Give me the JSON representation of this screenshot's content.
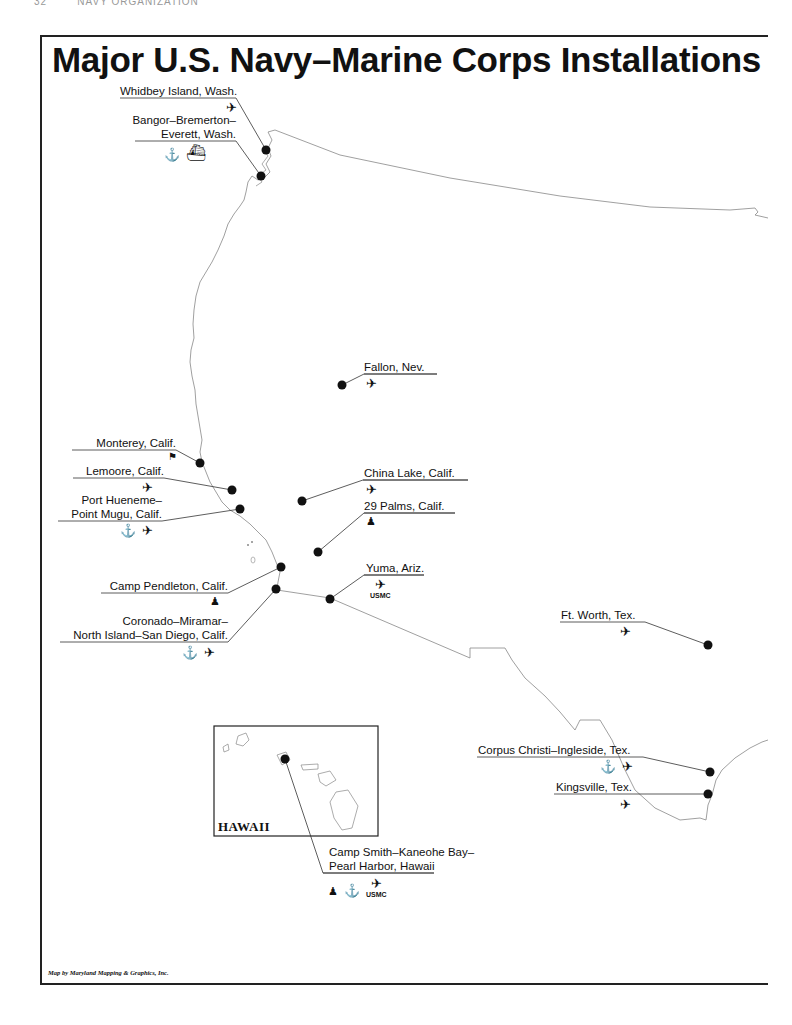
{
  "page": {
    "running_head": "32        NAVY ORGANIZATION"
  },
  "map": {
    "title": "Major U.S. Navy–Marine Corps Installations",
    "inset_label": "HAWAII",
    "credit": "Map by Maryland Mapping & Graphics, Inc.",
    "usmc_tag": "USMC",
    "installations": [
      {
        "id": "whidbey",
        "line1": "Whidbey Island, Wash.",
        "line2": "",
        "icons": [
          "airplane"
        ]
      },
      {
        "id": "bangor",
        "line1": "Bangor–Bremerton–",
        "line2": "Everett, Wash.",
        "icons": [
          "anchor",
          "ship"
        ]
      },
      {
        "id": "fallon",
        "line1": "Fallon, Nev.",
        "line2": "",
        "icons": [
          "airplane"
        ]
      },
      {
        "id": "monterey",
        "line1": "Monterey, Calif.",
        "line2": "",
        "icons": [
          "school-flag"
        ]
      },
      {
        "id": "lemoore",
        "line1": "Lemoore, Calif.",
        "line2": "",
        "icons": [
          "airplane"
        ]
      },
      {
        "id": "china-lake",
        "line1": "China Lake, Calif.",
        "line2": "",
        "icons": [
          "airplane"
        ]
      },
      {
        "id": "port-hueneme",
        "line1": "Port Hueneme–",
        "line2": "Point Mugu, Calif.",
        "icons": [
          "anchor",
          "airplane"
        ]
      },
      {
        "id": "29-palms",
        "line1": "29 Palms, Calif.",
        "line2": "",
        "icons": [
          "marine"
        ]
      },
      {
        "id": "camp-pendleton",
        "line1": "Camp Pendleton, Calif.",
        "line2": "",
        "icons": [
          "marine"
        ]
      },
      {
        "id": "yuma",
        "line1": "Yuma, Ariz.",
        "line2": "",
        "icons": [
          "airplane-usmc"
        ]
      },
      {
        "id": "san-diego",
        "line1": "Coronado–Miramar–",
        "line2": "North Island–San Diego, Calif.",
        "icons": [
          "anchor",
          "airplane"
        ]
      },
      {
        "id": "ft-worth",
        "line1": "Ft. Worth, Tex.",
        "line2": "",
        "icons": [
          "airplane"
        ]
      },
      {
        "id": "corpus-christi",
        "line1": "Corpus Christi–Ingleside, Tex.",
        "line2": "",
        "icons": [
          "anchor",
          "airplane"
        ]
      },
      {
        "id": "kingsville",
        "line1": "Kingsville, Tex.",
        "line2": "",
        "icons": [
          "airplane"
        ]
      },
      {
        "id": "hawaii",
        "line1": "Camp Smith–Kaneohe Bay–",
        "line2": "Pearl Harbor, Hawaii",
        "icons": [
          "marine",
          "anchor",
          "airplane-usmc"
        ]
      }
    ]
  },
  "icons": {
    "airplane": "✈",
    "anchor": "⚓",
    "ship": "⛴",
    "marine": "♟",
    "school-flag": "⚑"
  }
}
